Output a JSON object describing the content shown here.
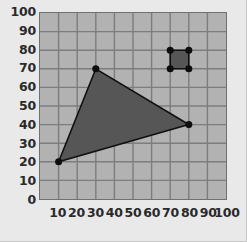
{
  "chart_data": {
    "type": "scatter",
    "title": "",
    "xlabel": "",
    "ylabel": "",
    "xlim": [
      0,
      100
    ],
    "ylim": [
      0,
      100
    ],
    "grid": true,
    "grid_step": 10,
    "legend": "none",
    "x_tick_labels": [
      "10",
      "20",
      "30",
      "40",
      "50",
      "60",
      "70",
      "80",
      "90",
      "100"
    ],
    "x_tick_values": [
      10,
      20,
      30,
      40,
      50,
      60,
      70,
      80,
      90,
      100
    ],
    "y_tick_labels": [
      "100",
      "90",
      "80",
      "70",
      "60",
      "50",
      "40",
      "30",
      "20",
      "10",
      "0"
    ],
    "y_tick_values": [
      100,
      90,
      80,
      70,
      60,
      50,
      40,
      30,
      20,
      10,
      0
    ],
    "shapes": [
      {
        "name": "triangle",
        "kind": "polygon",
        "points": [
          [
            10,
            20
          ],
          [
            30,
            70
          ],
          [
            80,
            40
          ]
        ],
        "fill": "#565656",
        "stroke": "#101010",
        "vertex_markers": true
      },
      {
        "name": "square",
        "kind": "polygon",
        "points": [
          [
            70,
            70
          ],
          [
            80,
            70
          ],
          [
            80,
            80
          ],
          [
            70,
            80
          ]
        ],
        "fill": "#565656",
        "stroke": "#101010",
        "vertex_markers": true
      }
    ],
    "colors": {
      "page_background": "#e9e9e9",
      "plot_background": "#b2b2b2",
      "gridline": "#7d7d7d",
      "axis_border": "#707070",
      "shape_fill": "#565656",
      "shape_stroke": "#101010",
      "marker": "#0d0d0d",
      "tick_label": "#2a2a2a"
    },
    "marker_radius_units": 1.9
  }
}
